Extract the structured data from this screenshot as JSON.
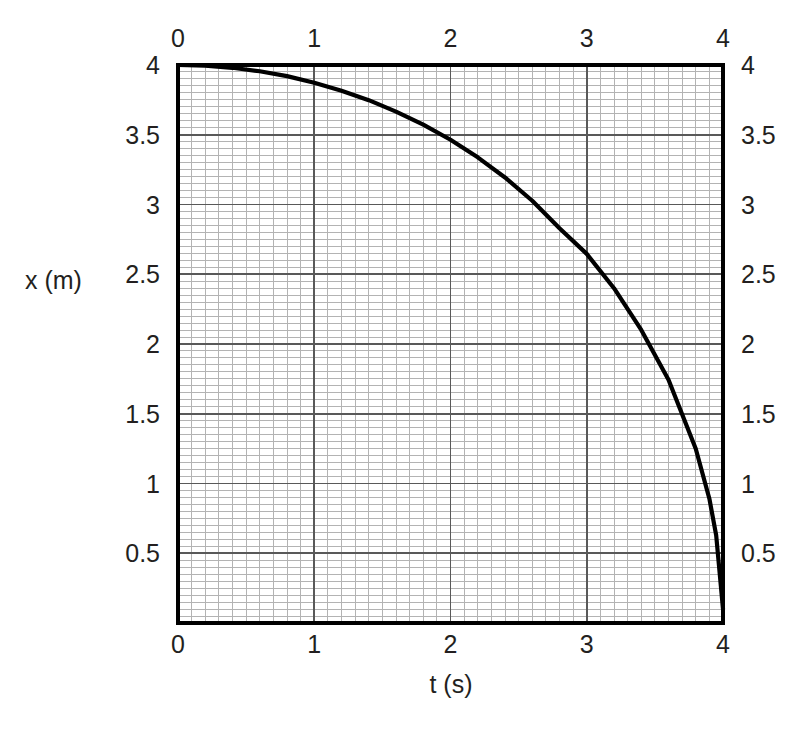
{
  "figure": {
    "width": 807,
    "height": 738,
    "background": "#ffffff",
    "ink_color": "#231f20",
    "curve_color": "#000000",
    "grid_major_color": "#595959",
    "grid_minor_color": "#b3b3b3",
    "frame_color": "#000000"
  },
  "chart_data": {
    "type": "line",
    "title": "",
    "subtitle": "",
    "xlabel": "t (s)",
    "ylabel": "x (m)",
    "xlim": [
      0,
      4
    ],
    "ylim": [
      0,
      4
    ],
    "grid": true,
    "grid_major_step": {
      "x": 1,
      "y": 0.5
    },
    "grid_minor_step": {
      "x": 0.1,
      "y": 0.05
    },
    "legend": "none",
    "axes": {
      "top_axis": true,
      "bottom_axis": true,
      "left_axis": true,
      "right_axis": true
    },
    "x_ticks": [
      0,
      1,
      2,
      3,
      4
    ],
    "x_tick_labels": [
      "0",
      "1",
      "2",
      "3",
      "4"
    ],
    "y_ticks": [
      0.5,
      1,
      1.5,
      2,
      2.5,
      3,
      3.5,
      4
    ],
    "y_tick_labels": [
      "0.5",
      "1",
      "1.5",
      "2",
      "2.5",
      "3",
      "3.5",
      "4"
    ],
    "series": [
      {
        "name": "x(t)",
        "x": [
          0,
          0.2,
          0.4,
          0.6,
          0.8,
          1.0,
          1.2,
          1.4,
          1.6,
          1.8,
          2.0,
          2.2,
          2.4,
          2.6,
          2.8,
          3.0,
          3.2,
          3.4,
          3.6,
          3.8,
          3.9,
          3.95,
          4.0
        ],
        "y": [
          4.0,
          3.995,
          3.98,
          3.955,
          3.92,
          3.873,
          3.816,
          3.748,
          3.666,
          3.573,
          3.464,
          3.338,
          3.194,
          3.027,
          2.83,
          2.646,
          2.4,
          2.101,
          1.744,
          1.249,
          0.891,
          0.628,
          0.1
        ]
      }
    ],
    "x_tick_labels_top": [
      "0",
      "1",
      "2",
      "3",
      "4"
    ],
    "y_tick_labels_right": [
      "0.5",
      "1",
      "1.5",
      "2",
      "2.5",
      "3",
      "3.5",
      "4"
    ]
  },
  "labels": {
    "y_axis_title": "x (m)",
    "x_axis_title": "t (s)"
  }
}
